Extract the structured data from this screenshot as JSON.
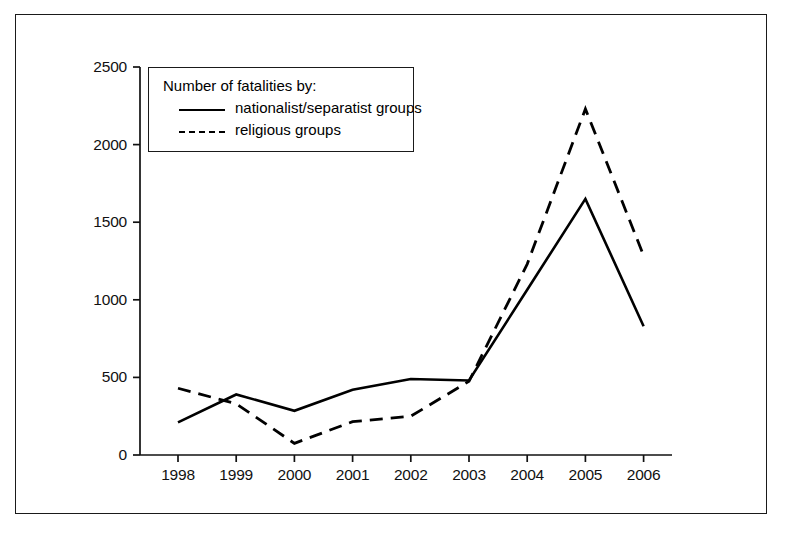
{
  "chart_data": {
    "type": "line",
    "title": "",
    "subtitle": "",
    "xlabel": "",
    "ylabel": "",
    "categories": [
      "1998",
      "1999",
      "2000",
      "2001",
      "2002",
      "2003",
      "2004",
      "2005",
      "2006"
    ],
    "x_tick_labels": [
      "1998",
      "1999",
      "2000",
      "2001",
      "2002",
      "2003",
      "2004",
      "2005",
      "2006"
    ],
    "y_tick_labels": [
      "0",
      "500",
      "1000",
      "1500",
      "2000",
      "2500"
    ],
    "y_ticks": [
      0,
      500,
      1000,
      1500,
      2000,
      2500
    ],
    "ylim": [
      0,
      2500
    ],
    "grid": false,
    "legend_position": "upper-left-inside",
    "legend_title": "Number of fatalities by:",
    "series": [
      {
        "name": "nationalist/separatist groups",
        "style": "solid",
        "color": "#000000",
        "values": [
          210,
          390,
          285,
          420,
          490,
          480,
          1065,
          1650,
          830
        ]
      },
      {
        "name": "religious groups",
        "style": "dashed",
        "color": "#000000",
        "values": [
          430,
          330,
          75,
          215,
          250,
          475,
          1230,
          2230,
          1285
        ]
      }
    ]
  },
  "legend": {
    "title": "Number of fatalities by:",
    "entries": [
      {
        "label": "nationalist/separatist groups",
        "style": "solid"
      },
      {
        "label": "religious groups",
        "style": "dashed"
      }
    ]
  }
}
